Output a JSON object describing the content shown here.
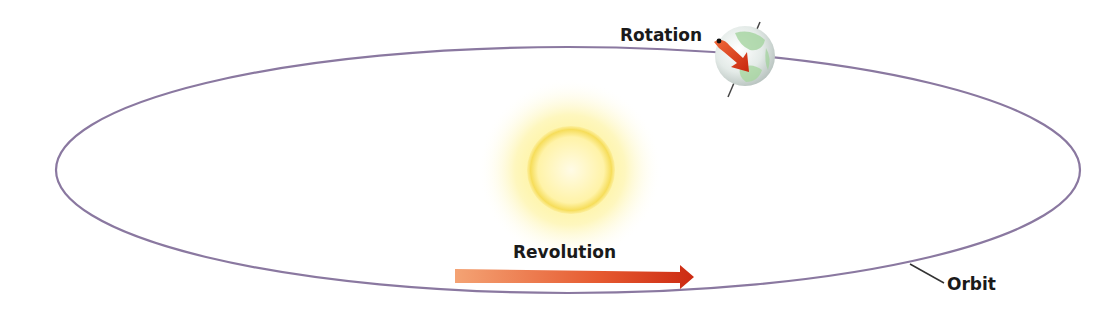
{
  "labels": {
    "rotation": "Rotation",
    "revolution": "Revolution",
    "orbit": "Orbit"
  },
  "colors": {
    "orbit": "#8a78a0",
    "sun_core": "#fff6b0",
    "sun_glow": "#fde96a",
    "arrow_start": "#f4a070",
    "arrow_end": "#d8321a",
    "earth_land": "#8fc98a",
    "earth_sea": "#e8efec",
    "text": "#1a1a1a"
  },
  "elements": {
    "sun": "sun",
    "earth": "earth",
    "orbit": "elliptical orbit",
    "revolution_arrow": "arrow pointing right",
    "rotation_arrow": "curved arrow around earth"
  }
}
